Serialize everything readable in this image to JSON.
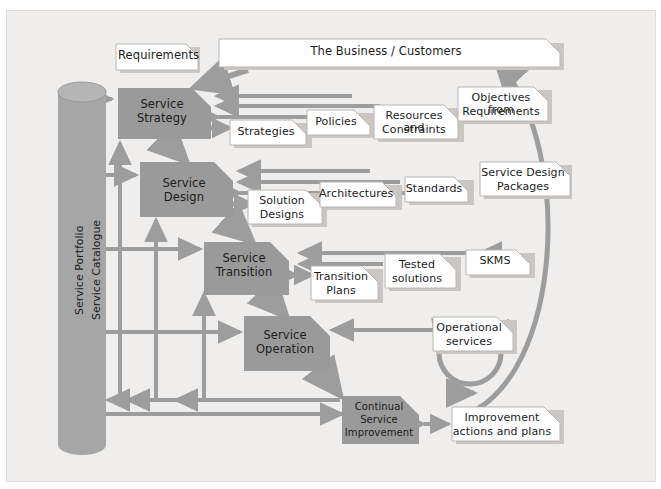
{
  "diagram": {
    "background_color": "#f0eeec",
    "process_fill": "#9a9a9a",
    "tag_fill": "#ffffff",
    "arrow_color": "#9d9d9d",
    "text_color": "#1c1c1c"
  },
  "repository": {
    "name": "service-portfolio-cylinder",
    "line1": "Service Portfolio",
    "line2": "Service Catalogue"
  },
  "banners": [
    {
      "id": "requirements",
      "label": "Requirements"
    },
    {
      "id": "business-customers",
      "label": "The Business / Customers"
    }
  ],
  "processes": [
    {
      "id": "service-strategy",
      "line1": "Service",
      "line2": "Strategy",
      "line3": ""
    },
    {
      "id": "service-design",
      "line1": "Service",
      "line2": "Design",
      "line3": ""
    },
    {
      "id": "service-transition",
      "line1": "Service",
      "line2": "Transition",
      "line3": ""
    },
    {
      "id": "service-operation",
      "line1": "Service",
      "line2": "Operation",
      "line3": ""
    },
    {
      "id": "continual-service-improvement",
      "line1": "Continual",
      "line2": "Service",
      "line3": "Improvement"
    }
  ],
  "artifacts": {
    "strategy_row": [
      {
        "id": "strategies",
        "line1": "Strategies",
        "line2": ""
      },
      {
        "id": "policies",
        "line1": "Policies",
        "line2": ""
      },
      {
        "id": "resources-and-constraints",
        "line1": "Resources and",
        "line2": "Constraints"
      },
      {
        "id": "objectives-from-requirements",
        "line1": "Objectives from",
        "line2": "Requirements"
      }
    ],
    "design_row": [
      {
        "id": "solution-designs",
        "line1": "Solution",
        "line2": "Designs"
      },
      {
        "id": "architectures",
        "line1": "Architectures",
        "line2": ""
      },
      {
        "id": "standards",
        "line1": "Standards",
        "line2": ""
      },
      {
        "id": "service-design-packages",
        "line1": "Service Design",
        "line2": "Packages"
      }
    ],
    "transition_row": [
      {
        "id": "transition-plans",
        "line1": "Transition",
        "line2": "Plans"
      },
      {
        "id": "tested-solutions",
        "line1": "Tested",
        "line2": "solutions"
      },
      {
        "id": "skms",
        "line1": "SKMS",
        "line2": ""
      }
    ],
    "operation_row": [
      {
        "id": "operational-services",
        "line1": "Operational",
        "line2": "services"
      }
    ],
    "csi_row": [
      {
        "id": "improvement-actions-and-plans",
        "line1": "Improvement",
        "line2": "actions and plans"
      }
    ]
  }
}
